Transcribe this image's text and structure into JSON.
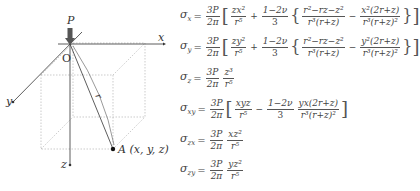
{
  "diagram": {
    "load_label": "P",
    "origin_label": "O",
    "axis_x_label": "x",
    "axis_y_label": "y",
    "axis_z_label": "z",
    "radius_label": "r",
    "point_label": "A (x, y, z)",
    "colors": {
      "lines": "#333333",
      "dashed": "#999999",
      "arrow": "#555555"
    }
  },
  "equations": [
    {
      "symbol": "σ",
      "sub": "x",
      "coef_num": "3P",
      "coef_den": "2π",
      "t1_num": "zx²",
      "t1_den": "r⁵",
      "op": "+",
      "t2_num": "1−2ν",
      "t2_den": "3",
      "t3_num": "r²−rz−z²",
      "t3_den": "r³(r+z)",
      "op2": "−",
      "t4_num": "x²(2r+z)",
      "t4_den": "r³(r+z)²"
    },
    {
      "symbol": "σ",
      "sub": "y",
      "coef_num": "3P",
      "coef_den": "2π",
      "t1_num": "zy²",
      "t1_den": "r⁵",
      "op": "+",
      "t2_num": "1−2ν",
      "t2_den": "3",
      "t3_num": "r²−rz−z²",
      "t3_den": "r³(r+z)",
      "op2": "−",
      "t4_num": "y²(2r+z)",
      "t4_den": "r³(r+z)²"
    },
    {
      "symbol": "σ",
      "sub": "z",
      "coef_num": "3P",
      "coef_den": "2π",
      "t1_num": "z³",
      "t1_den": "r⁵"
    },
    {
      "symbol": "σ",
      "sub": "xy",
      "coef_num": "3P",
      "coef_den": "2π",
      "t1_num": "xyz",
      "t1_den": "r⁵",
      "op": "−",
      "t2_num": "1−2ν",
      "t2_den": "3",
      "t3_num": "yx(2r+z)",
      "t3_den": "r³(r+z)²"
    },
    {
      "symbol": "σ",
      "sub": "zx",
      "coef_num": "3P",
      "coef_den": "2π",
      "t1_num": "xz²",
      "t1_den": "r⁵"
    },
    {
      "symbol": "σ",
      "sub": "zy",
      "coef_num": "3P",
      "coef_den": "2π",
      "t1_num": "yz²",
      "t1_den": "r⁵"
    }
  ],
  "equals": "="
}
